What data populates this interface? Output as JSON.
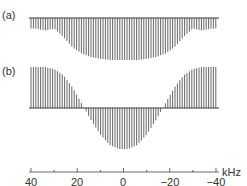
{
  "chart_data": [
    {
      "type": "bar",
      "panel": "(a)",
      "title": "",
      "xlabel": "kHz",
      "xlim": [
        40,
        -40
      ],
      "baseline": "top",
      "description": "stick spectrum hanging below baseline; shallow shoulders near ±35 kHz, deep broad trough between ~±25 kHz",
      "x": [
        38,
        34,
        30,
        26,
        22,
        18,
        14,
        10,
        6,
        2,
        -2,
        -6,
        -10,
        -14,
        -18,
        -22,
        -26,
        -30,
        -34,
        -38
      ],
      "values": [
        -0.25,
        -0.3,
        -0.25,
        -0.45,
        -0.7,
        -0.85,
        -0.93,
        -0.97,
        -1.0,
        -1.0,
        -1.0,
        -1.0,
        -0.97,
        -0.93,
        -0.85,
        -0.7,
        -0.45,
        -0.25,
        -0.3,
        -0.25
      ]
    },
    {
      "type": "bar",
      "panel": "(b)",
      "title": "",
      "xlabel": "kHz",
      "xlim": [
        40,
        -40
      ],
      "baseline": "middle",
      "description": "stick spectrum: positive lobes at edges, negative lobe centered at 0 kHz; zero crossings near ±17 kHz",
      "x": [
        38,
        34,
        30,
        26,
        22,
        18,
        14,
        10,
        6,
        2,
        -2,
        -6,
        -10,
        -14,
        -18,
        -22,
        -26,
        -30,
        -34,
        -38
      ],
      "values": [
        1.0,
        1.0,
        0.95,
        0.8,
        0.5,
        0.1,
        -0.3,
        -0.65,
        -0.9,
        -1.0,
        -1.0,
        -0.9,
        -0.65,
        -0.3,
        0.1,
        0.5,
        0.8,
        0.95,
        1.0,
        1.0
      ]
    }
  ],
  "labels": {
    "panel_a": "(a)",
    "panel_b": "(b)",
    "unit": "kHz"
  },
  "axis": {
    "ticks": [
      "40",
      "20",
      "0",
      "−20",
      "−40"
    ]
  },
  "colors": {
    "stick": "#555555",
    "axis": "#333333"
  }
}
